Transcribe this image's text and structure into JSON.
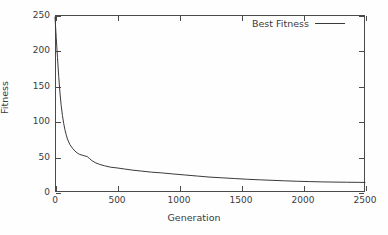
{
  "chart_data": {
    "type": "line",
    "title": "",
    "xlabel": "Generation",
    "ylabel": "Fitness",
    "xlim": [
      0,
      2500
    ],
    "ylim": [
      0,
      250
    ],
    "xticks": [
      0,
      500,
      1000,
      1500,
      2000,
      2500
    ],
    "yticks": [
      0,
      50,
      100,
      150,
      200,
      250
    ],
    "grid": false,
    "legend_position": "top-right",
    "legend": [
      "Best Fitness"
    ],
    "line_color": "#3a3a3a",
    "axis_color": "#4a4a4a",
    "text_color": "#3b3b3b",
    "background_color": "#fefefe",
    "series": [
      {
        "name": "Best Fitness",
        "x": [
          0,
          10,
          20,
          30,
          40,
          50,
          60,
          70,
          80,
          90,
          100,
          120,
          140,
          160,
          180,
          200,
          220,
          240,
          260,
          280,
          300,
          330,
          360,
          400,
          450,
          500,
          560,
          620,
          700,
          780,
          860,
          950,
          1050,
          1150,
          1250,
          1350,
          1450,
          1550,
          1650,
          1750,
          1850,
          1950,
          2050,
          2150,
          2250,
          2350,
          2450,
          2500
        ],
        "y": [
          247,
          218,
          190,
          163,
          140,
          122,
          108,
          97,
          88,
          81,
          75,
          67,
          62,
          58,
          55,
          53,
          52,
          51,
          50,
          47,
          44,
          41,
          39,
          37,
          35,
          34,
          32.5,
          31,
          29.5,
          28,
          27,
          25.5,
          24,
          22.5,
          21,
          20,
          19,
          18,
          17.2,
          16.5,
          15.8,
          15.2,
          14.7,
          14.3,
          14,
          13.8,
          13.6,
          13.5
        ]
      }
    ]
  }
}
